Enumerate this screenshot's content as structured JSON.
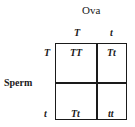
{
  "diagram": {
    "top_label": "Ova",
    "side_label": "Sperm",
    "columns": [
      "T",
      "t"
    ],
    "rows": [
      "T",
      "t"
    ],
    "cells": [
      [
        "TT",
        "Tt"
      ],
      [
        "Tt",
        "tt"
      ]
    ]
  }
}
